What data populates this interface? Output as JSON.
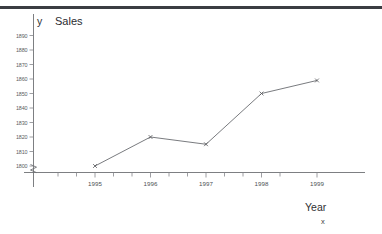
{
  "page": {
    "background_color": "#ffffff",
    "rule_color": "#3b3d42"
  },
  "axis_labels": {
    "y_axis_symbol": "y",
    "x_axis_symbol": "x",
    "x_axis_name": "Year",
    "plot_title": "Sales"
  },
  "chart_data": {
    "type": "line",
    "title": "Sales",
    "xlabel": "Year",
    "ylabel": "Sales",
    "x_axis_symbol": "x",
    "y_axis_symbol": "y",
    "categories": [
      "1995",
      "1996",
      "1997",
      "1998",
      "1999"
    ],
    "x": [
      1995,
      1996,
      1997,
      1998,
      1999
    ],
    "values": [
      1800,
      1820,
      1815,
      1850,
      1859
    ],
    "series": [
      {
        "name": "Sales",
        "values": [
          1800,
          1820,
          1815,
          1850,
          1859
        ]
      }
    ],
    "y_tick_labels": [
      "1800",
      "1810",
      "1820",
      "1830",
      "1840",
      "1850",
      "1860",
      "1870",
      "1880",
      "1890"
    ],
    "y_ticks": [
      1800,
      1810,
      1820,
      1830,
      1840,
      1850,
      1860,
      1870,
      1880,
      1890
    ],
    "x_tick_labels": [
      "1995",
      "1996",
      "1997",
      "1998",
      "1999"
    ],
    "ylim": [
      1795,
      1893
    ],
    "xlim": [
      1994.2,
      1999.9
    ],
    "grid": false,
    "legend": "none",
    "marker": "x",
    "axis_break": true,
    "line_color": "#6a6c70",
    "marker_color": "#55575b",
    "axis_color": "#6e7074",
    "tick_label_color": "#5a5c60"
  }
}
